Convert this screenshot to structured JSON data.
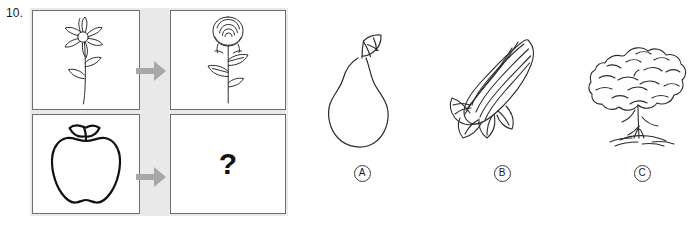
{
  "question": {
    "number": "10.",
    "prompt_symbol": "?"
  },
  "matrix": {
    "cells": [
      {
        "id": "top-left",
        "content": "daisy-flower-line-drawing"
      },
      {
        "id": "top-right",
        "content": "rose-flower-line-drawing"
      },
      {
        "id": "bottom-left",
        "content": "apple-outline-drawing"
      },
      {
        "id": "bottom-right",
        "content": "question-mark"
      }
    ],
    "arrows": [
      {
        "id": "top-arrow",
        "direction": "right"
      },
      {
        "id": "bottom-arrow",
        "direction": "right"
      }
    ]
  },
  "options": [
    {
      "label": "A",
      "content": "pear-line-drawing"
    },
    {
      "label": "B",
      "content": "corn-cob-line-drawing"
    },
    {
      "label": "C",
      "content": "tree-line-drawing"
    }
  ],
  "colors": {
    "matrix_background": "#e9e9e9",
    "cell_background": "#ffffff",
    "cell_border": "#6f6f6f",
    "arrow": "#a8a8a8",
    "ink": "#1a1a1a"
  }
}
